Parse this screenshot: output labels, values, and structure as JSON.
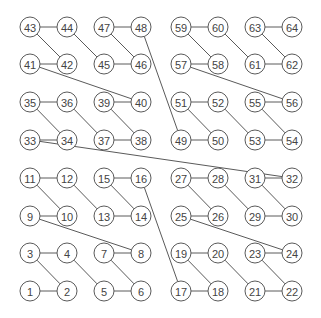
{
  "diagram": {
    "node_count": 64,
    "grid": {
      "cols": 8,
      "rows": 8
    },
    "column_x": [
      30,
      67,
      104,
      141,
      181,
      218,
      255,
      292
    ],
    "row_y_bottom_up": [
      291,
      253,
      216,
      178,
      140,
      102,
      64,
      27
    ],
    "node_radius": 10,
    "colors": {
      "stroke": "#5a5a5a",
      "text": "#444444",
      "fill": "#ffffff",
      "background": "#ffffff"
    },
    "nodes": [
      {
        "label": "1",
        "col": 0,
        "row": 0
      },
      {
        "label": "2",
        "col": 1,
        "row": 0
      },
      {
        "label": "3",
        "col": 0,
        "row": 1
      },
      {
        "label": "4",
        "col": 1,
        "row": 1
      },
      {
        "label": "5",
        "col": 2,
        "row": 0
      },
      {
        "label": "6",
        "col": 3,
        "row": 0
      },
      {
        "label": "7",
        "col": 2,
        "row": 1
      },
      {
        "label": "8",
        "col": 3,
        "row": 1
      },
      {
        "label": "9",
        "col": 0,
        "row": 2
      },
      {
        "label": "10",
        "col": 1,
        "row": 2
      },
      {
        "label": "11",
        "col": 0,
        "row": 3
      },
      {
        "label": "12",
        "col": 1,
        "row": 3
      },
      {
        "label": "13",
        "col": 2,
        "row": 2
      },
      {
        "label": "14",
        "col": 3,
        "row": 2
      },
      {
        "label": "15",
        "col": 2,
        "row": 3
      },
      {
        "label": "16",
        "col": 3,
        "row": 3
      },
      {
        "label": "17",
        "col": 4,
        "row": 0
      },
      {
        "label": "18",
        "col": 5,
        "row": 0
      },
      {
        "label": "19",
        "col": 4,
        "row": 1
      },
      {
        "label": "20",
        "col": 5,
        "row": 1
      },
      {
        "label": "21",
        "col": 6,
        "row": 0
      },
      {
        "label": "22",
        "col": 7,
        "row": 0
      },
      {
        "label": "23",
        "col": 6,
        "row": 1
      },
      {
        "label": "24",
        "col": 7,
        "row": 1
      },
      {
        "label": "25",
        "col": 4,
        "row": 2
      },
      {
        "label": "26",
        "col": 5,
        "row": 2
      },
      {
        "label": "27",
        "col": 4,
        "row": 3
      },
      {
        "label": "28",
        "col": 5,
        "row": 3
      },
      {
        "label": "29",
        "col": 6,
        "row": 2
      },
      {
        "label": "30",
        "col": 7,
        "row": 2
      },
      {
        "label": "31",
        "col": 6,
        "row": 3
      },
      {
        "label": "32",
        "col": 7,
        "row": 3
      },
      {
        "label": "33",
        "col": 0,
        "row": 4
      },
      {
        "label": "34",
        "col": 1,
        "row": 4
      },
      {
        "label": "35",
        "col": 0,
        "row": 5
      },
      {
        "label": "36",
        "col": 1,
        "row": 5
      },
      {
        "label": "37",
        "col": 2,
        "row": 4
      },
      {
        "label": "38",
        "col": 3,
        "row": 4
      },
      {
        "label": "39",
        "col": 2,
        "row": 5
      },
      {
        "label": "40",
        "col": 3,
        "row": 5
      },
      {
        "label": "41",
        "col": 0,
        "row": 6
      },
      {
        "label": "42",
        "col": 1,
        "row": 6
      },
      {
        "label": "43",
        "col": 0,
        "row": 7
      },
      {
        "label": "44",
        "col": 1,
        "row": 7
      },
      {
        "label": "45",
        "col": 2,
        "row": 6
      },
      {
        "label": "46",
        "col": 3,
        "row": 6
      },
      {
        "label": "47",
        "col": 2,
        "row": 7
      },
      {
        "label": "48",
        "col": 3,
        "row": 7
      },
      {
        "label": "49",
        "col": 4,
        "row": 4
      },
      {
        "label": "50",
        "col": 5,
        "row": 4
      },
      {
        "label": "51",
        "col": 4,
        "row": 5
      },
      {
        "label": "52",
        "col": 5,
        "row": 5
      },
      {
        "label": "53",
        "col": 6,
        "row": 4
      },
      {
        "label": "54",
        "col": 7,
        "row": 4
      },
      {
        "label": "55",
        "col": 6,
        "row": 5
      },
      {
        "label": "56",
        "col": 7,
        "row": 5
      },
      {
        "label": "57",
        "col": 4,
        "row": 6
      },
      {
        "label": "58",
        "col": 5,
        "row": 6
      },
      {
        "label": "59",
        "col": 4,
        "row": 7
      },
      {
        "label": "60",
        "col": 5,
        "row": 7
      },
      {
        "label": "61",
        "col": 6,
        "row": 6
      },
      {
        "label": "62",
        "col": 7,
        "row": 6
      },
      {
        "label": "63",
        "col": 6,
        "row": 7
      },
      {
        "label": "64",
        "col": 7,
        "row": 7
      }
    ],
    "edges": "sequential path 1-2-3-...-64"
  }
}
